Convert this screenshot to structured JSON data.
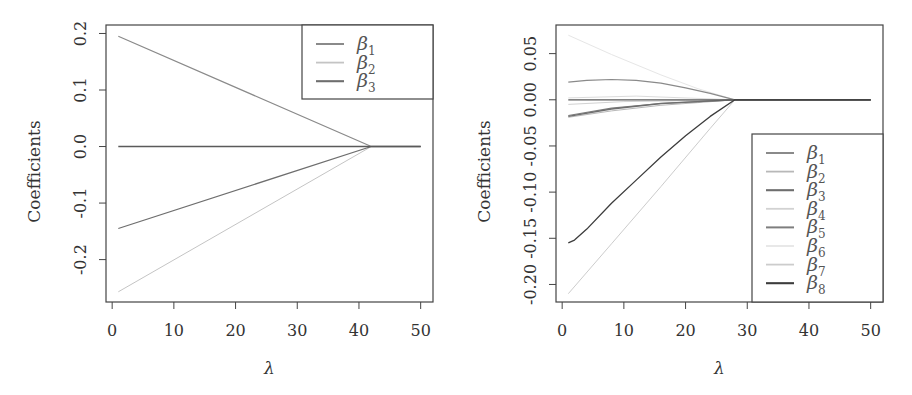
{
  "chart_data": [
    {
      "type": "line",
      "title": "",
      "xlabel": "λ",
      "ylabel": "Coefficients",
      "xlim": [
        -1,
        52
      ],
      "ylim": [
        -0.275,
        0.215
      ],
      "xticks": [
        0,
        10,
        20,
        30,
        40,
        50
      ],
      "xtick_labels": [
        "0",
        "10",
        "20",
        "30",
        "40",
        "50"
      ],
      "yticks": [
        -0.2,
        -0.1,
        0.0,
        0.1,
        0.2
      ],
      "ytick_labels": [
        "-0.2",
        "-0.1",
        "0.0",
        "0.1",
        "0.2"
      ],
      "grid": false,
      "legend_position": "top-right",
      "series": [
        {
          "name": "β1",
          "label": "β",
          "sub": "1",
          "color": "#8a8a8a",
          "width": 1.2,
          "x": [
            1,
            42,
            50
          ],
          "y": [
            0.195,
            0.0,
            0.0
          ]
        },
        {
          "name": "β2",
          "label": "β",
          "sub": "2",
          "color": "#c4c4c4",
          "width": 1.0,
          "x": [
            1,
            42,
            50
          ],
          "y": [
            -0.257,
            0.0,
            0.0
          ]
        },
        {
          "name": "β3",
          "label": "β",
          "sub": "3",
          "color": "#6e6e6e",
          "width": 1.3,
          "x": [
            1,
            42,
            50
          ],
          "y": [
            -0.145,
            0.0,
            0.0
          ]
        },
        {
          "name": "zero",
          "label": "",
          "sub": "",
          "color": "#5a5a5a",
          "width": 1.3,
          "legend": false,
          "x": [
            1,
            50
          ],
          "y": [
            0.0,
            0.0
          ]
        }
      ]
    },
    {
      "type": "line",
      "title": "",
      "xlabel": "λ",
      "ylabel": "Coefficients",
      "xlim": [
        -1,
        52
      ],
      "ylim": [
        -0.219,
        0.081
      ],
      "xticks": [
        0,
        10,
        20,
        30,
        40,
        50
      ],
      "xtick_labels": [
        "0",
        "10",
        "20",
        "30",
        "40",
        "50"
      ],
      "yticks": [
        -0.2,
        -0.15,
        -0.1,
        -0.05,
        0.0,
        0.05
      ],
      "ytick_labels": [
        "-0.20",
        "-0.15",
        "-0.10",
        "-0.05",
        "0.00",
        "0.05"
      ],
      "grid": false,
      "legend_position": "bottom-right",
      "series": [
        {
          "name": "β1",
          "label": "β",
          "sub": "1",
          "color": "#8a8a8a",
          "width": 1.2,
          "x": [
            1,
            4,
            8,
            12,
            16,
            20,
            24,
            28,
            50
          ],
          "y": [
            0.019,
            0.021,
            0.022,
            0.021,
            0.018,
            0.013,
            0.007,
            0.0,
            0.0
          ]
        },
        {
          "name": "β2",
          "label": "β",
          "sub": "2",
          "color": "#b8b8b8",
          "width": 1.0,
          "x": [
            1,
            8,
            16,
            22,
            28,
            50
          ],
          "y": [
            -0.019,
            -0.012,
            -0.006,
            -0.003,
            0.0,
            0.0
          ]
        },
        {
          "name": "β3",
          "label": "β",
          "sub": "3",
          "color": "#6e6e6e",
          "width": 1.3,
          "x": [
            1,
            8,
            16,
            22,
            28,
            50
          ],
          "y": [
            -0.018,
            -0.01,
            -0.004,
            -0.002,
            0.0,
            0.0
          ]
        },
        {
          "name": "β4",
          "label": "β",
          "sub": "4",
          "color": "#d2d2d2",
          "width": 1.0,
          "x": [
            1,
            10,
            20,
            28,
            50
          ],
          "y": [
            -0.005,
            -0.002,
            -0.001,
            0.0,
            0.0
          ]
        },
        {
          "name": "β5",
          "label": "β",
          "sub": "5",
          "color": "#7e7e7e",
          "width": 1.2,
          "x": [
            1,
            8,
            16,
            22,
            28,
            50
          ],
          "y": [
            -0.017,
            -0.009,
            -0.004,
            -0.002,
            0.0,
            0.0
          ]
        },
        {
          "name": "β6",
          "label": "β",
          "sub": "6",
          "color": "#e6e6e6",
          "width": 1.0,
          "x": [
            1,
            8,
            16,
            22,
            28,
            50
          ],
          "y": [
            0.07,
            0.049,
            0.027,
            0.012,
            0.0,
            0.0
          ]
        },
        {
          "name": "β7",
          "label": "β",
          "sub": "7",
          "color": "#cccccc",
          "width": 1.0,
          "x": [
            1,
            8,
            16,
            24,
            28,
            50
          ],
          "y": [
            -0.21,
            -0.156,
            -0.094,
            -0.031,
            0.0,
            0.0
          ]
        },
        {
          "name": "β8",
          "label": "β",
          "sub": "8",
          "color": "#3c3c3c",
          "width": 1.3,
          "x": [
            1,
            2,
            4,
            8,
            12,
            16,
            20,
            24,
            28,
            50
          ],
          "y": [
            -0.155,
            -0.152,
            -0.14,
            -0.112,
            -0.087,
            -0.062,
            -0.039,
            -0.018,
            0.0,
            0.0
          ]
        },
        {
          "name": "zero",
          "label": "",
          "sub": "",
          "color": "#5a5a5a",
          "width": 1.3,
          "legend": false,
          "x": [
            1,
            50
          ],
          "y": [
            0.0,
            0.0
          ]
        },
        {
          "name": "near-zero",
          "label": "",
          "sub": "",
          "color": "#dcdcdc",
          "width": 1.0,
          "legend": false,
          "x": [
            1,
            12,
            28
          ],
          "y": [
            0.002,
            0.004,
            0.0
          ]
        }
      ]
    }
  ],
  "panels": [
    {
      "id": "left",
      "plot": {
        "x0": 106,
        "y0": 25,
        "x1": 433,
        "y1": 302
      },
      "legend": {
        "x0": 302,
        "y0": 25,
        "x1": 433,
        "y1": 99
      },
      "ylabel_x": 40,
      "yticklabel_x": 86,
      "xticklabel_y": 336,
      "xlabel_y": 374
    },
    {
      "id": "right",
      "plot": {
        "x0": 556,
        "y0": 25,
        "x1": 883,
        "y1": 302
      },
      "legend": {
        "x0": 752,
        "y0": 134,
        "x1": 883,
        "y1": 302
      },
      "ylabel_x": 490,
      "yticklabel_x": 536,
      "xticklabel_y": 336,
      "xlabel_y": 374
    }
  ]
}
